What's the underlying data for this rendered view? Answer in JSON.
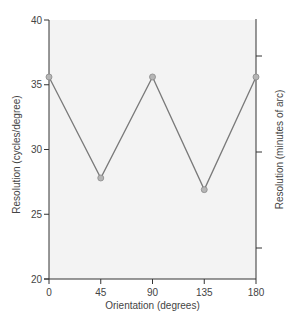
{
  "chart_data": {
    "type": "line",
    "title": "",
    "xlabel": "Orientation (degrees)",
    "ylabel": "Resolution (cycles/degree)",
    "y2label": "Resolution (minutes of arc)",
    "x": [
      0,
      45,
      90,
      135,
      180
    ],
    "categories": [
      "0",
      "45",
      "90",
      "135",
      "180"
    ],
    "series": [
      {
        "name": "Resolution",
        "values": [
          35.6,
          27.8,
          35.6,
          26.9,
          35.6
        ]
      }
    ],
    "xlim": [
      0,
      180
    ],
    "ylim": [
      20,
      40
    ],
    "yticks": [
      20,
      25,
      30,
      35,
      40
    ],
    "xticks": [
      0,
      45,
      90,
      135,
      180
    ],
    "y2_ticks_unlabeled": 3,
    "grid": false,
    "legend": "none"
  },
  "colors": {
    "plot_background": "#f3f3f3",
    "axis": "#333333",
    "line": "#7a7a7a",
    "marker_fill": "#b5b5b5",
    "marker_stroke": "#8a8a8a"
  }
}
